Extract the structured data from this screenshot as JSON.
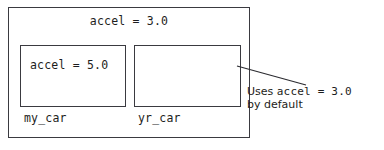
{
  "diagram": {
    "type": "class-instance-attribute-inheritance",
    "outer_box": {
      "name": "class-scope-box",
      "class_attribute_label": "accel = 3.0"
    },
    "instances": [
      {
        "name": "my_car",
        "attribute_label": "accel = 5.0",
        "has_override": true
      },
      {
        "name": "yr_car",
        "attribute_label": "",
        "has_override": false
      }
    ],
    "annotation": {
      "line1_prefix": "Uses ",
      "line1_code": "accel = 3.0",
      "line2": "by default"
    },
    "colors": {
      "stroke": "#3a3a40",
      "text": "#1d1d20",
      "background": "#ffffff",
      "leader_line": "#2b2b30"
    }
  }
}
